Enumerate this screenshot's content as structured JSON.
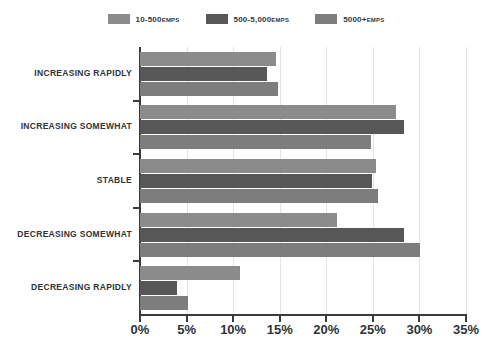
{
  "chart_data": {
    "type": "bar",
    "orientation": "horizontal",
    "title": "",
    "xlabel": "",
    "ylabel": "",
    "xlim": [
      0,
      35
    ],
    "xtick_labels": [
      "0%",
      "5%",
      "10%",
      "15%",
      "20%",
      "25%",
      "30%",
      "35%"
    ],
    "xtick_values": [
      0,
      5,
      10,
      15,
      20,
      25,
      30,
      35
    ],
    "grid": true,
    "legend_position": "top-center",
    "categories": [
      "INCREASING RAPIDLY",
      "INCREASING SOMEWHAT",
      "STABLE",
      "DECREASING SOMEWHAT",
      "DECREASING RAPIDLY"
    ],
    "series": [
      {
        "name": "10-500 EMPS",
        "label_main": "10-500",
        "label_sub": "EMPS",
        "color": "#8b8b8b",
        "values": [
          14.6,
          27.5,
          25.3,
          21.2,
          10.7
        ]
      },
      {
        "name": "500-5,000 EMPS",
        "label_main": "500-5,000",
        "label_sub": "EMPS",
        "color": "#575757",
        "values": [
          13.6,
          28.3,
          24.9,
          28.3,
          4.0
        ]
      },
      {
        "name": "5000+ EMPS",
        "label_main": "5000+",
        "label_sub": "EMPS",
        "color": "#7d7d7d",
        "values": [
          14.8,
          24.8,
          25.6,
          30.1,
          5.2
        ]
      }
    ]
  },
  "colors": {
    "axis": "#3a3a3a",
    "grid": "#e3e3e3",
    "text": "#2f3337",
    "background": "#ffffff"
  }
}
